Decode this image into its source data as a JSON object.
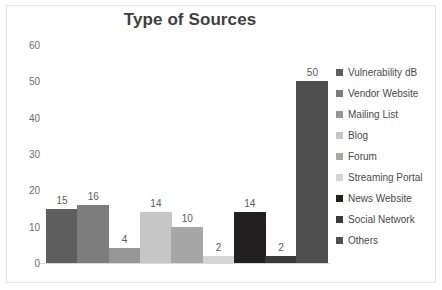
{
  "chart_data": {
    "type": "bar",
    "title": "Type of Sources",
    "xlabel": "",
    "ylabel": "",
    "ylim": [
      0,
      60
    ],
    "yticks": [
      60,
      50,
      40,
      30,
      20,
      10,
      0
    ],
    "grid": false,
    "legend_position": "right",
    "categories": [
      "Vulnerability dB",
      "Vendor Website",
      "Mailing List",
      "Blog",
      "Forum",
      "Streaming Portal",
      "News Website",
      "Social Network",
      "Others"
    ],
    "values": [
      15,
      16,
      4,
      14,
      10,
      2,
      14,
      2,
      50
    ],
    "colors": [
      "#5e5e5e",
      "#7d7d7d",
      "#969696",
      "#c6c6c6",
      "#a6a6a6",
      "#d5d5d5",
      "#231f20",
      "#3a3a3a",
      "#4f4f4f"
    ],
    "data_labels": [
      "15",
      "16",
      "4",
      "14",
      "10",
      "2",
      "14",
      "2",
      "50"
    ]
  },
  "legend": {
    "items": [
      {
        "label": "Vulnerability dB",
        "color": "#5e5e5e"
      },
      {
        "label": "Vendor Website",
        "color": "#7d7d7d"
      },
      {
        "label": "Mailing List",
        "color": "#969696"
      },
      {
        "label": "Blog",
        "color": "#c6c6c6"
      },
      {
        "label": "Forum",
        "color": "#a6a6a6"
      },
      {
        "label": "Streaming Portal",
        "color": "#d5d5d5"
      },
      {
        "label": "News Website",
        "color": "#231f20"
      },
      {
        "label": "Social Network",
        "color": "#3a3a3a"
      },
      {
        "label": "Others",
        "color": "#4f4f4f"
      }
    ]
  }
}
